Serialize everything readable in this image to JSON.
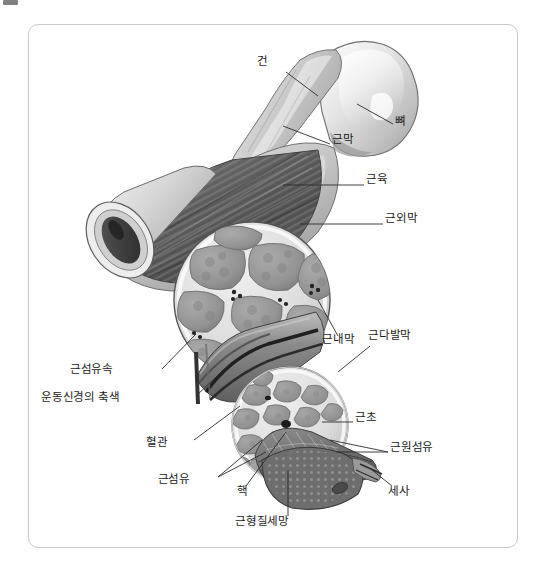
{
  "page": {
    "background_color": "#ffffff",
    "frame": {
      "border_color": "#c9c9c9",
      "fill_color": "#ffffff",
      "corner_radius_px": 10
    },
    "top_left_stub": {
      "name": "cropped-toolbar-stub",
      "color": "#6b6b6b"
    }
  },
  "figure": {
    "kind": "anatomical-illustration",
    "style": "grayscale-airbrush-rendering",
    "palette": {
      "bone_light": "#e3e3e3",
      "bone_mid": "#bdbdbd",
      "tendon": "#d2d2d2",
      "muscle_dark": "#5d5d5d",
      "muscle_mid": "#8a8a8a",
      "fascicle": "#9a9a9a",
      "perimysium": "#ececec",
      "vessel_dark": "#3a3a3a",
      "outline": "#4a4a4a",
      "leader_line": "#2b2b2b"
    }
  },
  "labels": [
    {
      "id": "tendon",
      "text": "건",
      "x": 268,
      "y": 62,
      "anchor": "right",
      "leader": [
        [
          286,
          72
        ],
        [
          318,
          96
        ]
      ]
    },
    {
      "id": "bone",
      "text": "뼈",
      "x": 395,
      "y": 122,
      "anchor": "left",
      "leader": [
        [
          393,
          124
        ],
        [
          357,
          104
        ]
      ]
    },
    {
      "id": "fascia",
      "text": "근막",
      "x": 332,
      "y": 140,
      "anchor": "left",
      "leader": [
        [
          330,
          144
        ],
        [
          283,
          126
        ]
      ]
    },
    {
      "id": "muscle",
      "text": "근육",
      "x": 366,
      "y": 180,
      "anchor": "left",
      "leader": [
        [
          364,
          185
        ],
        [
          283,
          185
        ]
      ]
    },
    {
      "id": "epimysium",
      "text": "근외막",
      "x": 385,
      "y": 219,
      "anchor": "left",
      "leader": [
        [
          383,
          224
        ],
        [
          300,
          224
        ]
      ]
    },
    {
      "id": "endomysium",
      "text": "근내막",
      "x": 322,
      "y": 340,
      "anchor": "left",
      "leader": [
        [
          338,
          336
        ],
        [
          318,
          300
        ]
      ]
    },
    {
      "id": "perimysium",
      "text": "근다발막",
      "x": 368,
      "y": 336,
      "anchor": "left",
      "leader": [
        [
          370,
          346
        ],
        [
          338,
          372
        ]
      ]
    },
    {
      "id": "fascicle",
      "text": "근섬유속",
      "x": 113,
      "y": 370,
      "anchor": "right",
      "leader": [
        [
          162,
          369
        ],
        [
          196,
          334
        ]
      ]
    },
    {
      "id": "motor-axon",
      "text": "운동신경의 축색",
      "x": 120,
      "y": 398,
      "anchor": "right",
      "leader": [
        [
          196,
          396
        ],
        [
          232,
          362
        ]
      ]
    },
    {
      "id": "sarcolemma",
      "text": "근초",
      "x": 355,
      "y": 418,
      "anchor": "left",
      "leader": [
        [
          353,
          422
        ],
        [
          322,
          422
        ]
      ]
    },
    {
      "id": "blood-vessel",
      "text": "혈관",
      "x": 168,
      "y": 443,
      "anchor": "right",
      "leader": [
        [
          194,
          440
        ],
        [
          240,
          406
        ]
      ]
    },
    {
      "id": "myofibril",
      "text": "근원섬유",
      "x": 390,
      "y": 448,
      "anchor": "left",
      "leader": [
        [
          388,
          452
        ],
        [
          336,
          452
        ]
      ]
    },
    {
      "id": "muscle-fiber",
      "text": "근섬유",
      "x": 190,
      "y": 480,
      "anchor": "right",
      "leader": [
        [
          218,
          477
        ],
        [
          266,
          452
        ]
      ]
    },
    {
      "id": "nucleus",
      "text": "핵",
      "x": 242,
      "y": 492,
      "anchor": "center",
      "leader": [
        [
          246,
          486
        ],
        [
          286,
          440
        ]
      ]
    },
    {
      "id": "thin-filament",
      "text": "세사",
      "x": 388,
      "y": 492,
      "anchor": "left",
      "leader": [
        [
          392,
          486
        ],
        [
          372,
          468
        ]
      ]
    },
    {
      "id": "sarcoplasmic-reticulum",
      "text": "근형질세망",
      "x": 262,
      "y": 522,
      "anchor": "center",
      "leader": [
        [
          288,
          516
        ],
        [
          288,
          470
        ]
      ]
    }
  ]
}
